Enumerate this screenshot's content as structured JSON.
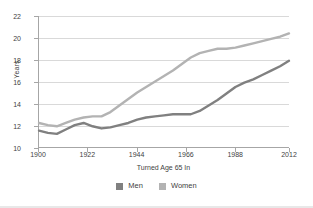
{
  "chart_data": {
    "type": "line",
    "title": "",
    "subtitle": "",
    "xlabel": "Turned Age 65 In",
    "ylabel": "Years",
    "xlim": [
      1900,
      2012
    ],
    "ylim": [
      10,
      22
    ],
    "ytick_step": 2,
    "grid": "horizontal",
    "legend_position": "bottom-center",
    "xticks": [
      "1900",
      "1922",
      "1944",
      "1966",
      "1988",
      "2012"
    ],
    "yticks": [
      "10",
      "12",
      "14",
      "16",
      "18",
      "20",
      "22"
    ],
    "x": [
      1900,
      1904,
      1908,
      1912,
      1916,
      1920,
      1924,
      1928,
      1932,
      1936,
      1940,
      1944,
      1948,
      1952,
      1956,
      1960,
      1964,
      1968,
      1972,
      1976,
      1980,
      1984,
      1988,
      1992,
      1996,
      2000,
      2004,
      2008,
      2012
    ],
    "series": [
      {
        "name": "Men",
        "color": "#808080",
        "values": [
          11.5,
          11.3,
          11.2,
          11.6,
          12.0,
          12.2,
          11.9,
          11.7,
          11.8,
          12.0,
          12.2,
          12.5,
          12.7,
          12.8,
          12.9,
          13.0,
          13.0,
          13.0,
          13.3,
          13.8,
          14.3,
          14.9,
          15.5,
          15.9,
          16.2,
          16.6,
          17.0,
          17.4,
          17.9
        ]
      },
      {
        "name": "Women",
        "color": "#b3b3b3",
        "values": [
          12.2,
          12.0,
          11.9,
          12.2,
          12.5,
          12.7,
          12.8,
          12.8,
          13.2,
          13.8,
          14.4,
          15.0,
          15.5,
          16.0,
          16.5,
          17.0,
          17.6,
          18.2,
          18.6,
          18.8,
          19.0,
          19.0,
          19.1,
          19.3,
          19.5,
          19.7,
          19.9,
          20.1,
          20.4
        ]
      }
    ]
  },
  "legend": {
    "items": [
      {
        "label": "Men",
        "color": "#808080"
      },
      {
        "label": "Women",
        "color": "#b3b3b3"
      }
    ]
  },
  "colors": {
    "men": "#808080",
    "women": "#b3b3b3",
    "axis": "#a6a6a6",
    "grid": "#d9d9d9",
    "text": "#3f3f3f",
    "background": "#ffffff"
  }
}
